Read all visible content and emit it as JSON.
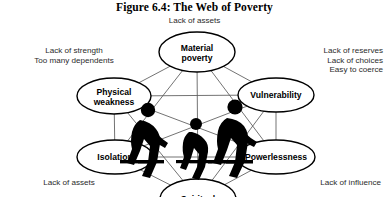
{
  "figure": {
    "title": "Figure 6.4: The Web of Poverty"
  },
  "captions": {
    "top": "Lack of assets",
    "top_left_line1": "Lack of strength",
    "top_left_line2": "Too many dependents",
    "top_right_line1": "Lack of reserves",
    "top_right_line2": "Lack of choices",
    "top_right_line3": "Easy to coerce",
    "bottom_left": "Lack of assets",
    "bottom_right": "Lack of influence"
  },
  "nodes": [
    {
      "id": "material-poverty",
      "label_line1": "Material",
      "label_line2": "poverty",
      "cx": 197,
      "cy": 52,
      "rx": 38,
      "ry": 20
    },
    {
      "id": "vulnerability",
      "label_line1": "Vulnerability",
      "label_line2": "",
      "cx": 276,
      "cy": 95,
      "rx": 38,
      "ry": 17
    },
    {
      "id": "powerlessness",
      "label_line1": "Powerlessness",
      "label_line2": "",
      "cx": 276,
      "cy": 157,
      "rx": 39,
      "ry": 17
    },
    {
      "id": "spiritual",
      "label_line1": "Spiritual",
      "label_line2": "",
      "cx": 198,
      "cy": 199,
      "rx": 38,
      "ry": 20
    },
    {
      "id": "isolation",
      "label_line1": "Isolation",
      "label_line2": "",
      "cx": 115,
      "cy": 157,
      "rx": 38,
      "ry": 17
    },
    {
      "id": "physical-weakness",
      "label_line1": "Physical",
      "label_line2": "weakness",
      "cx": 114,
      "cy": 96,
      "rx": 37,
      "ry": 18
    }
  ],
  "colors": {
    "ink": "#000000",
    "web_line": "#5a5a5a",
    "background": "#ffffff"
  }
}
